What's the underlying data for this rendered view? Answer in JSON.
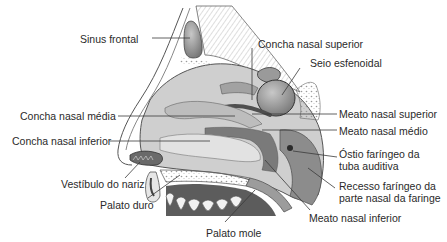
{
  "diagram": {
    "colors": {
      "background": "#ffffff",
      "text": "#2a2a2a",
      "leader_line": "#3a3a3a",
      "tissue_light": "#d9d9d9",
      "tissue_mid": "#a8a8a8",
      "tissue_dark": "#6e6e6e",
      "bone_pattern": "#ececec"
    },
    "labels": [
      {
        "id": "sinus-frontal",
        "text": "Sinus frontal",
        "x": 80,
        "y": 33
      },
      {
        "id": "concha-nasal-superior",
        "text": "Concha nasal superior",
        "x": 258,
        "y": 38
      },
      {
        "id": "seio-esfenoidal",
        "text": "Seio esfenoidal",
        "x": 310,
        "y": 57
      },
      {
        "id": "concha-nasal-media",
        "text": "Concha nasal média",
        "x": 20,
        "y": 110
      },
      {
        "id": "meato-nasal-superior",
        "text": "Meato nasal superior",
        "x": 339,
        "y": 107
      },
      {
        "id": "meato-nasal-medio",
        "text": "Meato nasal médio",
        "x": 339,
        "y": 125
      },
      {
        "id": "concha-nasal-inferior",
        "text": "Concha nasal inferior",
        "x": 12,
        "y": 135
      },
      {
        "id": "ostio-faringeo",
        "text": "Óstio faríngeo da tuba auditiva",
        "lines": [
          "Óstio faríngeo da",
          "tuba auditiva"
        ],
        "x": 339,
        "y": 148
      },
      {
        "id": "vestibulo-do-nariz",
        "text": "Vestíbulo do nariz",
        "x": 61,
        "y": 178
      },
      {
        "id": "recesso-faringeo",
        "text": "Recesso faríngeo da parte nasal da faringe",
        "lines": [
          "Recesso faríngeo da",
          "parte nasal da faringe"
        ],
        "x": 339,
        "y": 180
      },
      {
        "id": "palato-duro",
        "text": "Palato duro",
        "x": 100,
        "y": 199
      },
      {
        "id": "meato-nasal-inferior",
        "text": "Meato nasal inferior",
        "x": 309,
        "y": 212
      },
      {
        "id": "palato-mole",
        "text": "Palato mole",
        "x": 206,
        "y": 227
      }
    ]
  }
}
